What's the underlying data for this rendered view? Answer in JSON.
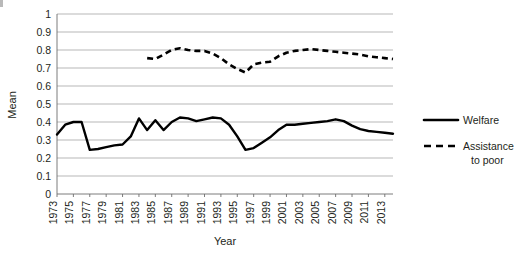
{
  "chart_data": {
    "type": "line",
    "title": "",
    "xlabel": "Year",
    "ylabel": "Mean",
    "xlim": [
      1973,
      2014
    ],
    "ylim": [
      0,
      1
    ],
    "grid": true,
    "legend_position": "right",
    "y_ticks": [
      "0",
      "0.1",
      "0.2",
      "0.3",
      "0.4",
      "0.5",
      "0.6",
      "0.7",
      "0.8",
      "0.9",
      "1"
    ],
    "x_ticks": [
      "1973",
      "1975",
      "1977",
      "1979",
      "1981",
      "1983",
      "1985",
      "1987",
      "1989",
      "1991",
      "1993",
      "1995",
      "1997",
      "1999",
      "2001",
      "2003",
      "2005",
      "2007",
      "2009",
      "2011",
      "2013"
    ],
    "series": [
      {
        "name": "Welfare",
        "style": "solid",
        "color": "#000000",
        "x": [
          1973,
          1974,
          1975,
          1976,
          1977,
          1978,
          1979,
          1980,
          1981,
          1982,
          1983,
          1984,
          1985,
          1986,
          1987,
          1988,
          1989,
          1990,
          1991,
          1992,
          1993,
          1994,
          1995,
          1996,
          1997,
          1998,
          1999,
          2000,
          2001,
          2002,
          2003,
          2004,
          2005,
          2006,
          2007,
          2008,
          2009,
          2010,
          2011,
          2012,
          2013,
          2014
        ],
        "values": [
          0.33,
          0.385,
          0.4,
          0.4,
          0.245,
          0.25,
          0.26,
          0.27,
          0.275,
          0.32,
          0.42,
          0.355,
          0.41,
          0.355,
          0.4,
          0.425,
          0.42,
          0.405,
          0.415,
          0.425,
          0.42,
          0.385,
          0.32,
          0.245,
          0.255,
          0.285,
          0.315,
          0.355,
          0.385,
          0.385,
          0.39,
          0.395,
          0.4,
          0.405,
          0.415,
          0.405,
          0.38,
          0.36,
          0.35,
          0.345,
          0.34,
          0.335
        ]
      },
      {
        "name": "Assistance to poor",
        "style": "dashed",
        "color": "#000000",
        "x": [
          1984,
          1985,
          1986,
          1987,
          1988,
          1989,
          1990,
          1991,
          1992,
          1993,
          1994,
          1995,
          1996,
          1997,
          1998,
          1999,
          2000,
          2001,
          2002,
          2003,
          2004,
          2005,
          2006,
          2007,
          2008,
          2009,
          2010,
          2011,
          2012,
          2013,
          2014
        ],
        "values": [
          0.755,
          0.75,
          0.775,
          0.8,
          0.81,
          0.8,
          0.795,
          0.795,
          0.78,
          0.755,
          0.72,
          0.695,
          0.675,
          0.72,
          0.73,
          0.735,
          0.765,
          0.785,
          0.795,
          0.8,
          0.805,
          0.8,
          0.795,
          0.79,
          0.785,
          0.78,
          0.775,
          0.765,
          0.76,
          0.755,
          0.75
        ]
      }
    ]
  },
  "legend": {
    "items": [
      {
        "label": "Welfare",
        "label2": "",
        "style": "solid"
      },
      {
        "label": "Assistance",
        "label2": "to poor",
        "style": "dashed"
      }
    ]
  }
}
